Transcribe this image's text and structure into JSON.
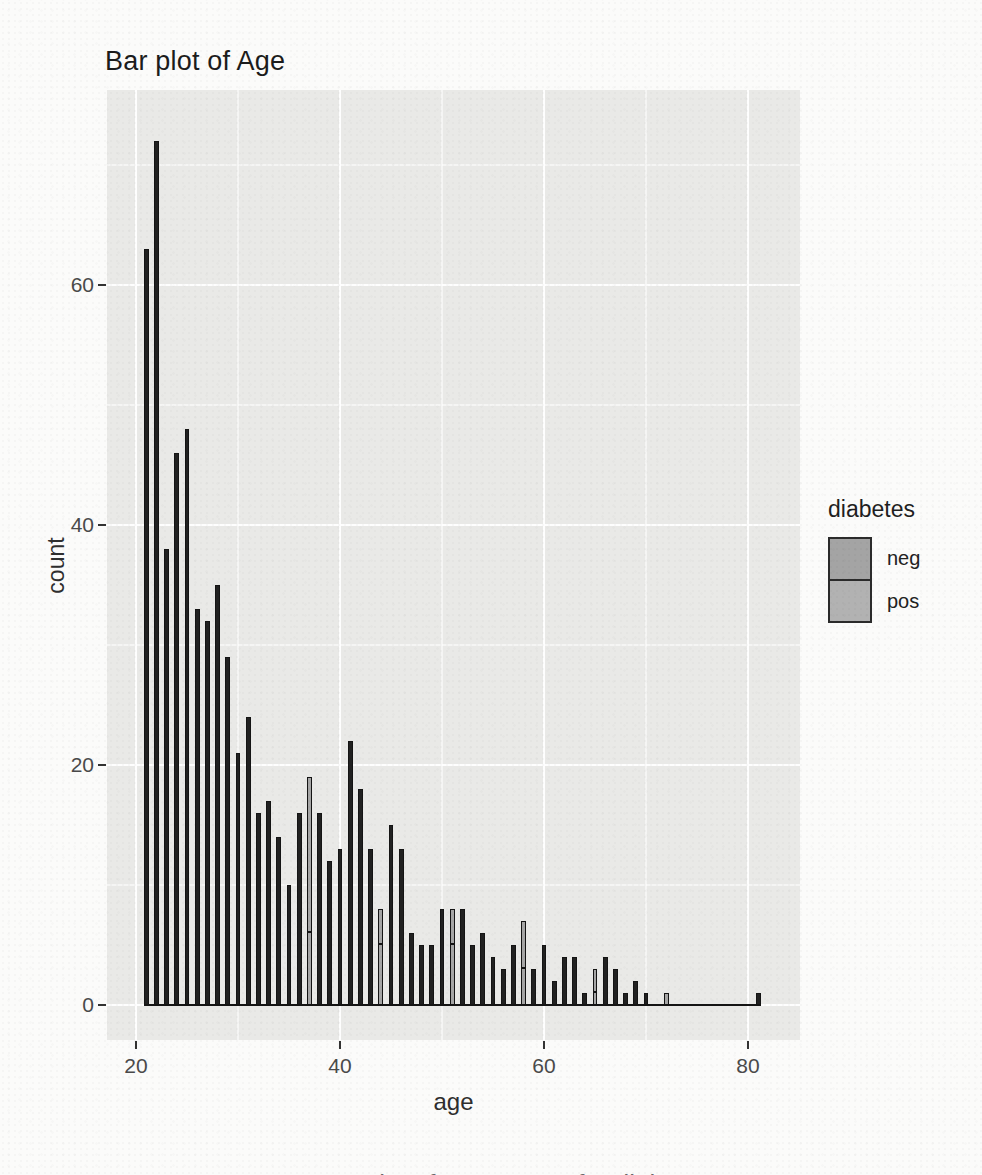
{
  "title": "Bar plot of Age",
  "axes": {
    "x": {
      "label": "age",
      "ticks": [
        20,
        40,
        60,
        80
      ]
    },
    "y": {
      "label": "count",
      "ticks": [
        0,
        20,
        40,
        60
      ]
    }
  },
  "legend": {
    "title": "diabetes",
    "entries": [
      {
        "label": "neg",
        "fill": "#a4a4a4"
      },
      {
        "label": "pos",
        "fill": "#b2b2b2"
      }
    ]
  },
  "chart_data": {
    "type": "bar",
    "title": "Bar plot of Age",
    "xlabel": "age",
    "ylabel": "count",
    "x": [
      21,
      22,
      23,
      24,
      25,
      26,
      27,
      28,
      29,
      30,
      31,
      32,
      33,
      34,
      35,
      36,
      37,
      38,
      39,
      40,
      41,
      42,
      43,
      44,
      45,
      46,
      47,
      48,
      49,
      50,
      51,
      52,
      53,
      54,
      55,
      56,
      57,
      58,
      59,
      60,
      61,
      62,
      63,
      64,
      65,
      66,
      67,
      68,
      69,
      70,
      71,
      72,
      73,
      74,
      75,
      76,
      77,
      78,
      79,
      80,
      81
    ],
    "values": [
      63,
      72,
      38,
      46,
      48,
      33,
      32,
      35,
      29,
      21,
      24,
      16,
      17,
      14,
      10,
      16,
      19,
      16,
      12,
      13,
      22,
      18,
      13,
      8,
      15,
      13,
      6,
      5,
      5,
      8,
      8,
      8,
      5,
      6,
      4,
      3,
      5,
      7,
      3,
      5,
      2,
      4,
      4,
      1,
      3,
      4,
      3,
      1,
      2,
      1,
      0,
      1,
      0,
      0,
      0,
      0,
      0,
      0,
      0,
      0,
      1
    ],
    "xlim": [
      17.2,
      85.1
    ],
    "ylim": [
      0,
      76
    ],
    "grid": "major-and-minor-white-on-gray",
    "legend_position": "right",
    "legend_title": "diabetes",
    "legend_labels": [
      "neg",
      "pos"
    ],
    "bar_fill": "#212121",
    "bar_outline": "#141414",
    "gray_bar_fill": "#a6a6a6",
    "gray_bars": [
      {
        "age": 37,
        "split": 6
      },
      {
        "age": 44,
        "split": 5
      },
      {
        "age": 51,
        "split": 5
      },
      {
        "age": 58,
        "split": 3
      },
      {
        "age": 65,
        "split": 1
      },
      {
        "age": 72,
        "split": 0
      }
    ],
    "panel_background": "#e9e9e7"
  },
  "caption_clipped": "Bar plot of age counts for diabetes"
}
